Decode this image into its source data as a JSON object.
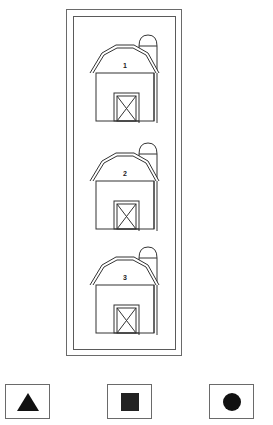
{
  "scene": {
    "frame": {
      "outer_border_color": "#6a6a6a",
      "inner_border_color": "#5a5a5a"
    },
    "barns": [
      {
        "label": "1"
      },
      {
        "label": "2"
      },
      {
        "label": "3"
      }
    ],
    "answer_shapes": [
      {
        "shape": "triangle",
        "fill": "#111111"
      },
      {
        "shape": "square",
        "fill": "#222222"
      },
      {
        "shape": "circle",
        "fill": "#111111"
      }
    ]
  }
}
